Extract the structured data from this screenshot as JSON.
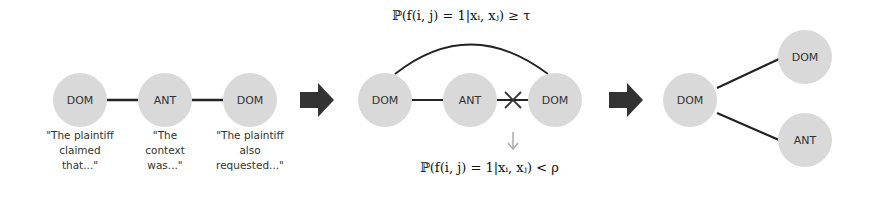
{
  "panels": [
    {
      "id": "initial-chain",
      "nodes": [
        {
          "label": "DOM",
          "cx": 80,
          "cy": 100,
          "caption": "\"The plaintiff\nclaimed\nthat...\""
        },
        {
          "label": "ANT",
          "cx": 165,
          "cy": 100,
          "caption": "\"The\ncontext\nwas...\""
        },
        {
          "label": "DOM",
          "cx": 250,
          "cy": 100,
          "caption": "\"The plaintiff\nalso\nrequested...\""
        }
      ]
    },
    {
      "id": "edge-update",
      "nodes": [
        {
          "label": "DOM",
          "cx": 385,
          "cy": 100
        },
        {
          "label": "ANT",
          "cx": 470,
          "cy": 100
        },
        {
          "label": "DOM",
          "cx": 555,
          "cy": 100
        }
      ],
      "add_edge_condition": "ℙ(f(i, j) = 1|xᵢ, xⱼ) ≥ τ",
      "remove_edge_condition": "ℙ(f(i, j) = 1|xᵢ, xⱼ) < ρ"
    },
    {
      "id": "final-tree",
      "nodes": [
        {
          "label": "DOM",
          "cx": 690,
          "cy": 100
        },
        {
          "label": "DOM",
          "cx": 805,
          "cy": 57
        },
        {
          "label": "ANT",
          "cx": 805,
          "cy": 140
        }
      ]
    }
  ],
  "colors": {
    "node_fill": "#d9d9d9",
    "edge": "#222222",
    "arrow": "#333333",
    "down_arrow": "#aaaaaa"
  }
}
